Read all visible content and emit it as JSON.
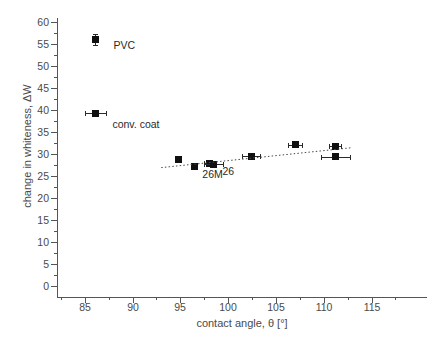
{
  "chart_data": {
    "type": "scatter",
    "title": "",
    "xlabel": "contact angle, θ [°]",
    "ylabel": "change in whiteness, ΔW",
    "xlim": [
      82.1,
      120.8
    ],
    "ylim": [
      -2.5,
      60.9
    ],
    "xticks": [
      85,
      90,
      95,
      100,
      105,
      110,
      115
    ],
    "xtick_labels": [
      "85",
      "90",
      "95",
      "100",
      "105",
      "110",
      "115"
    ],
    "yticks": [
      0,
      5,
      10,
      15,
      20,
      25,
      30,
      35,
      40,
      45,
      50,
      55,
      60
    ],
    "ytick_labels": [
      "0",
      "5",
      "10",
      "15",
      "20",
      "25",
      "30",
      "35",
      "40",
      "45",
      "50",
      "55",
      "60"
    ],
    "minor_ticks": true,
    "grid": false,
    "legend": "none",
    "marker": "filled-square",
    "marker_color": "#101010",
    "points": [
      {
        "label": "PVC",
        "x": 86.1,
        "y": 56.0,
        "xerr": 0.0,
        "yerr": 1.2,
        "annotated": true
      },
      {
        "label": "conv. coat",
        "x": 86.1,
        "y": 39.2,
        "xerr": 1.1,
        "yerr": 0.0,
        "annotated": true
      },
      {
        "label": "",
        "x": 94.8,
        "y": 28.8,
        "xerr": 0.0,
        "yerr": 0.0,
        "annotated": false
      },
      {
        "label": "",
        "x": 96.5,
        "y": 27.1,
        "xerr": 0.0,
        "yerr": 0.0,
        "annotated": false
      },
      {
        "label": "26M",
        "x": 98.0,
        "y": 27.9,
        "xerr": 0.55,
        "yerr": 0.0,
        "annotated": true
      },
      {
        "label": "26",
        "x": 98.5,
        "y": 27.7,
        "xerr": 1.0,
        "yerr": 0.0,
        "annotated": true
      },
      {
        "label": "",
        "x": 102.4,
        "y": 29.5,
        "xerr": 0.9,
        "yerr": 0.0,
        "annotated": false
      },
      {
        "label": "",
        "x": 107.0,
        "y": 32.1,
        "xerr": 0.7,
        "yerr": 0.0,
        "annotated": false
      },
      {
        "label": "",
        "x": 111.2,
        "y": 31.8,
        "xerr": 0.65,
        "yerr": 0.0,
        "annotated": false
      },
      {
        "label": "",
        "x": 111.2,
        "y": 29.4,
        "xerr": 1.5,
        "yerr": 0.0,
        "annotated": false
      }
    ],
    "trendline": {
      "style": "dotted",
      "color": "#4a4a4a",
      "x_start": 93.0,
      "y_start": 26.9,
      "x_end": 112.8,
      "y_end": 31.4
    },
    "annotations": [
      {
        "text": "PVC",
        "x": 88.0,
        "y": 54.5
      },
      {
        "text": "conv. coat",
        "x": 87.9,
        "y": 36.6
      },
      {
        "text": "26M",
        "x": 97.3,
        "y": 25.2
      },
      {
        "text": "26",
        "x": 99.4,
        "y": 25.8
      }
    ]
  },
  "figure": {
    "background": "#ffffff",
    "axis_color": "#555555",
    "text_color": "#4a4a4a"
  }
}
